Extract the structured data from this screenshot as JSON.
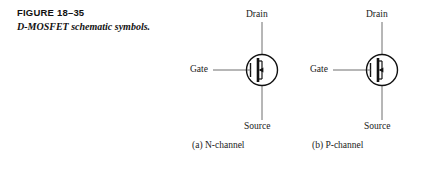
{
  "figure": {
    "number": "FIGURE 18–35",
    "caption": "D-MOSFET schematic symbols."
  },
  "colors": {
    "background": "#ffffff",
    "ink": "#1a1a1a",
    "lead_line": "#6e6e6e",
    "symbol_stroke": "#111111"
  },
  "symbols": [
    {
      "id": "n-channel",
      "sub_caption": "(a) N-channel",
      "terminals": {
        "drain": "Drain",
        "gate": "Gate",
        "source": "Source"
      },
      "arrow_direction": "left",
      "channel_type": "N"
    },
    {
      "id": "p-channel",
      "sub_caption": "(b) P-channel",
      "terminals": {
        "drain": "Drain",
        "gate": "Gate",
        "source": "Source"
      },
      "arrow_direction": "left",
      "channel_type": "P"
    }
  ]
}
